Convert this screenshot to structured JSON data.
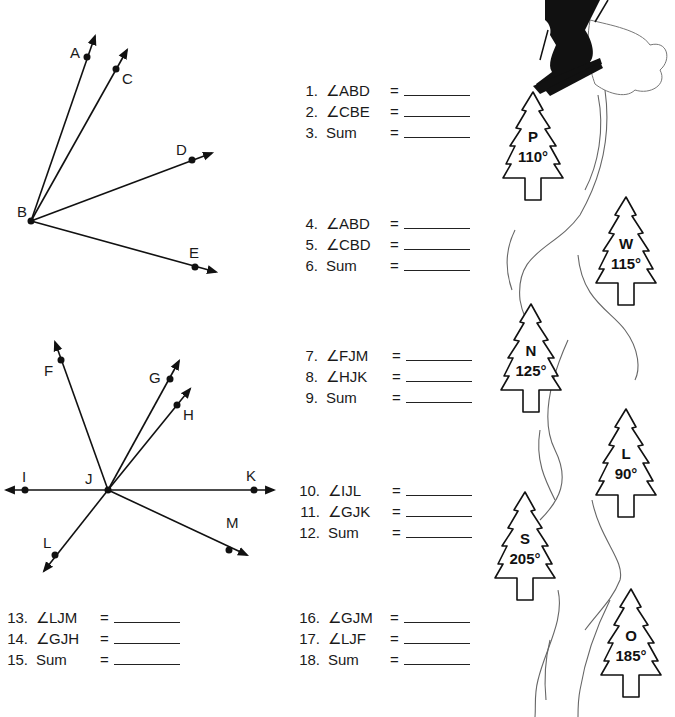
{
  "figure1": {
    "vertex": "B",
    "points": [
      "A",
      "C",
      "D",
      "E"
    ]
  },
  "figure2": {
    "vertex": "J",
    "points": [
      "F",
      "G",
      "H",
      "I",
      "K",
      "L",
      "M"
    ]
  },
  "questions": {
    "group1": [
      {
        "num": "1.",
        "expr": "∠ABD",
        "eq": "="
      },
      {
        "num": "2.",
        "expr": "∠CBE",
        "eq": "="
      },
      {
        "num": "3.",
        "expr": "Sum",
        "eq": "="
      }
    ],
    "group2": [
      {
        "num": "4.",
        "expr": "∠ABD",
        "eq": "="
      },
      {
        "num": "5.",
        "expr": "∠CBD",
        "eq": "="
      },
      {
        "num": "6.",
        "expr": "Sum",
        "eq": "="
      }
    ],
    "group3": [
      {
        "num": "7.",
        "expr": "∠FJM",
        "eq": "="
      },
      {
        "num": "8.",
        "expr": "∠HJK",
        "eq": "="
      },
      {
        "num": "9.",
        "expr": "Sum",
        "eq": "="
      }
    ],
    "group4": [
      {
        "num": "10.",
        "expr": "∠IJL",
        "eq": "="
      },
      {
        "num": "11.",
        "expr": "∠GJK",
        "eq": "="
      },
      {
        "num": "12.",
        "expr": "Sum",
        "eq": "="
      }
    ],
    "group5": [
      {
        "num": "13.",
        "expr": "∠LJM",
        "eq": "="
      },
      {
        "num": "14.",
        "expr": "∠GJH",
        "eq": "="
      },
      {
        "num": "15.",
        "expr": "Sum",
        "eq": "="
      }
    ],
    "group6": [
      {
        "num": "16.",
        "expr": "∠GJM",
        "eq": "="
      },
      {
        "num": "17.",
        "expr": "∠LJF",
        "eq": "="
      },
      {
        "num": "18.",
        "expr": "Sum",
        "eq": "="
      }
    ]
  },
  "trees": [
    {
      "letter": "P",
      "value": "110°"
    },
    {
      "letter": "W",
      "value": "115°"
    },
    {
      "letter": "N",
      "value": "125°"
    },
    {
      "letter": "L",
      "value": "90°"
    },
    {
      "letter": "S",
      "value": "205°"
    },
    {
      "letter": "O",
      "value": "185°"
    }
  ]
}
